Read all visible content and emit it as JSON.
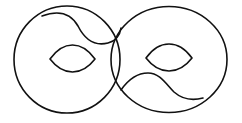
{
  "figure": {
    "stroke_color": "#111111",
    "background": "#ffffff",
    "stroke_width": 1.6
  },
  "shapes": {
    "left_circle": {
      "cx": 67,
      "cy": 59.5,
      "rx": 53,
      "ry": 53.5
    },
    "right_circle": {
      "cx": 169,
      "cy": 59.5,
      "rx": 58,
      "ry": 53
    },
    "left_curve": {
      "d": "M 42 16 C 58 10, 70 12, 78 26 C 86 42, 96 46, 108 43 C 116 41, 120 35, 121 28"
    },
    "right_curve": {
      "d": "M 121 90 C 128 80, 136 73, 148 73 C 160 73, 166 84, 174 92 C 182 99, 192 101, 203 98"
    },
    "left_eye": {
      "d": "M 50 59 Q 60 45, 72.5 45 Q 85 45, 95 59 Q 85 72, 72.5 72 Q 60 72, 50 59 Z"
    },
    "right_eye": {
      "d": "M 146 58 Q 156 44, 169 44 Q 182 44, 192 58 Q 182 71, 169 71 Q 156 71, 146 58 Z"
    }
  }
}
